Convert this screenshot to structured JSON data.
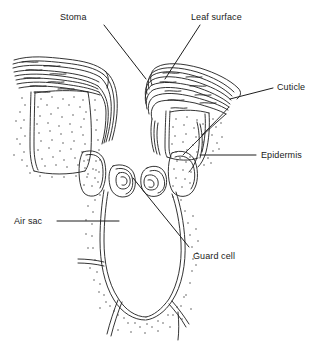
{
  "figure": {
    "ink_color": "#1d1d1d",
    "background_color": "#ffffff",
    "stipple_color": "#3a3a3a",
    "label_font_size_px": 9
  },
  "labels": [
    {
      "id": "stoma",
      "text": "Stoma",
      "x": 60,
      "y": 13,
      "leader": {
        "x1": 104,
        "y1": 25,
        "x2": 146,
        "y2": 79
      }
    },
    {
      "id": "leaf-surface",
      "text": "Leaf surface",
      "x": 191,
      "y": 13,
      "leader": {
        "x1": 200,
        "y1": 25,
        "x2": 165,
        "y2": 79
      }
    },
    {
      "id": "cuticle",
      "text": "Cuticle",
      "x": 277,
      "y": 83,
      "leader": {
        "x1": 273,
        "y1": 88,
        "x2": 230,
        "y2": 99
      }
    },
    {
      "id": "epidermis",
      "text": "Epidermis",
      "x": 261,
      "y": 151,
      "leader": {
        "x1": 256,
        "y1": 155,
        "x2": 200,
        "y2": 155
      }
    },
    {
      "id": "air-sac",
      "text": "Air sac",
      "x": 14,
      "y": 217,
      "leader": {
        "x1": 57,
        "y1": 221,
        "x2": 119,
        "y2": 221
      }
    },
    {
      "id": "guard-cell",
      "text": "Guard cell",
      "x": 193,
      "y": 252,
      "leader": {
        "x1": 189,
        "y1": 247,
        "x2": 133,
        "y2": 178
      }
    }
  ],
  "structures": [
    {
      "id": "cuticle-left",
      "name": "Cuticle layer (left)",
      "description": "Wavy stacked ink lines forming the outer waxy layer over the left epidermal cell"
    },
    {
      "id": "cuticle-right",
      "name": "Cuticle layer (right)",
      "description": "Wavy stacked ink lines forming the outer waxy layer over the right epidermal cell"
    },
    {
      "id": "epidermal-cell-left",
      "name": "Epidermal cell (left)",
      "description": "Stippled rectangular cell beneath the left cuticle"
    },
    {
      "id": "epidermal-cell-right",
      "name": "Epidermal cell (right)",
      "description": "Stippled rectangular cell beneath the right cuticle"
    },
    {
      "id": "guard-cell-left",
      "name": "Guard cell (left)",
      "description": "Small rounded cell left of the pore with an inner nucleus outline"
    },
    {
      "id": "guard-cell-right",
      "name": "Guard cell (right)",
      "description": "Small rounded cell right of the pore with an inner nucleus outline"
    },
    {
      "id": "subsidiary-left",
      "name": "Subsidiary cell (left)",
      "description": "Stippled lobed cell between left epidermal cell and left guard cell"
    },
    {
      "id": "subsidiary-right",
      "name": "Subsidiary cell (right)",
      "description": "Stippled lobed cell between right epidermal cell and right guard cell"
    },
    {
      "id": "stomatal-pore",
      "name": "Stomatal pore",
      "description": "Open gap between the two guard cells leading into the air sac"
    },
    {
      "id": "air-sac-cavity",
      "name": "Air sac (substomatal cavity)",
      "description": "Large U-shaped internal air space below the pore bounded by double cell walls"
    },
    {
      "id": "mesophyll-walls",
      "name": "Mesophyll cell walls",
      "description": "Branching Y-shaped wall lines radiating from the base of the air sac"
    }
  ]
}
